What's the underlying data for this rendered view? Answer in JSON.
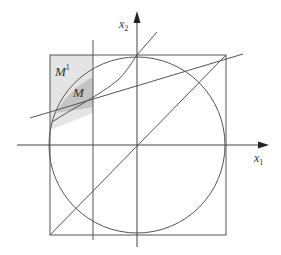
{
  "diagram": {
    "axes": {
      "x_label": "x",
      "x_sub": "1",
      "y_label": "x",
      "y_sub": "2"
    },
    "regions": {
      "outer_label": "M",
      "outer_sup": "1",
      "inner_label": "M"
    },
    "colors": {
      "line": "#555555",
      "outer_fill": "#e4e4e4",
      "inner_fill": "#c4c4c4",
      "background": "#ffffff"
    },
    "elements": [
      "x1-axis",
      "x2-axis",
      "bounding-square",
      "inscribed-circle",
      "diagonal-line",
      "tangent-line",
      "vertical-line",
      "s-curve"
    ]
  }
}
